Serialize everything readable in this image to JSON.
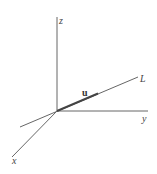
{
  "diagram": {
    "axes": {
      "x_label": "x",
      "y_label": "y",
      "z_label": "z"
    },
    "line_label": "L",
    "vector_label": "u"
  }
}
